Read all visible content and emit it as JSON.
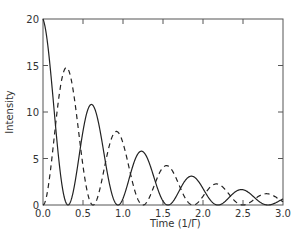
{
  "chart_data": {
    "type": "line",
    "title": "",
    "xlabel": "Time  (1/Γ)",
    "ylabel": "Intensity",
    "xlim": [
      0,
      3.0
    ],
    "ylim": [
      0,
      20
    ],
    "xticks": [
      "0.0",
      "0.5",
      "1.0",
      "1.5",
      "2.0",
      "2.5",
      "3.0"
    ],
    "yticks": [
      "0",
      "5",
      "10",
      "15",
      "20"
    ],
    "grid": false,
    "legend": null,
    "series": [
      {
        "name": "solid",
        "style": "solid",
        "model": "20*exp(-t)*cos^2(pi*t/0.625)",
        "peaks": [
          [
            0.0,
            20.0
          ],
          [
            0.62,
            10.8
          ],
          [
            1.25,
            5.8
          ],
          [
            1.87,
            3.1
          ],
          [
            2.5,
            1.7
          ]
        ],
        "zeros": [
          0.31,
          0.94,
          1.56,
          2.19,
          2.81
        ]
      },
      {
        "name": "dashed",
        "style": "dashed",
        "model": "20*exp(-t)*sin^2(pi*t/0.625)",
        "peaks": [
          [
            0.31,
            14.7
          ],
          [
            0.94,
            7.9
          ],
          [
            1.56,
            4.3
          ],
          [
            2.19,
            2.3
          ],
          [
            2.81,
            1.3
          ]
        ],
        "zeros": [
          0.0,
          0.62,
          1.25,
          1.87,
          2.5
        ]
      }
    ]
  }
}
